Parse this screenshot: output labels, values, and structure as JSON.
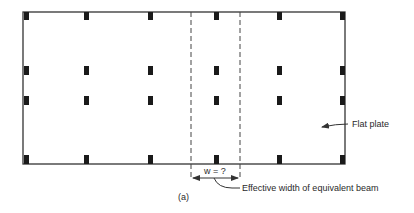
{
  "figure": {
    "label": "(a)",
    "plate_label": "Flat plate",
    "width_label": "w = ?",
    "width_caption": "Effective width of equivalent beam"
  },
  "geometry": {
    "plate": {
      "x": 23,
      "y": 12,
      "w": 322,
      "h": 152
    },
    "column_x": [
      26,
      86,
      150,
      216,
      279,
      342
    ],
    "column_y": [
      15,
      70,
      100,
      159
    ],
    "strip_x": [
      191,
      240
    ]
  },
  "colors": {
    "line": "#333333",
    "column": "#1a1a1a",
    "text": "#2a2a2a"
  }
}
